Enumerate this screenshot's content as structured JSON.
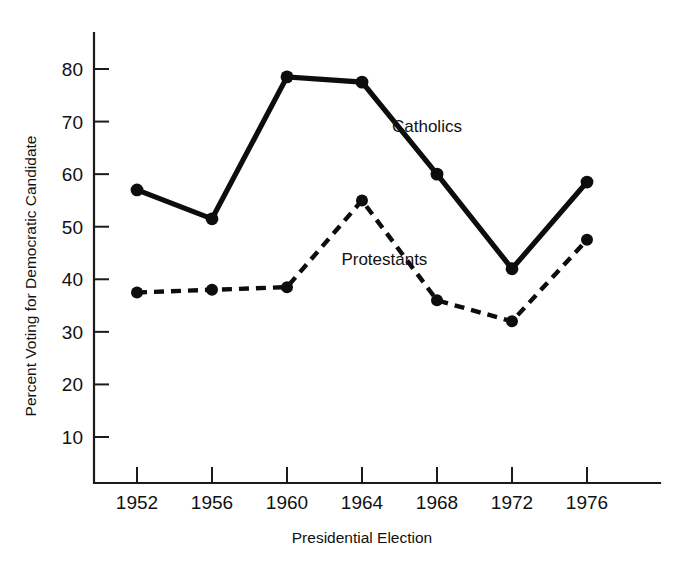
{
  "chart_data": {
    "type": "line",
    "title": "",
    "xlabel": "Presidential Election",
    "ylabel": "Percent Voting for Democratic Candidate",
    "categories": [
      "1952",
      "1956",
      "1960",
      "1964",
      "1968",
      "1972",
      "1976"
    ],
    "x": [
      1952,
      1956,
      1960,
      1964,
      1968,
      1972,
      1976
    ],
    "series": [
      {
        "name": "Catholics",
        "style": "solid",
        "marker": "filled-circle",
        "values": [
          57,
          51.5,
          78.5,
          77.5,
          60,
          42,
          58.5
        ]
      },
      {
        "name": "Protestants",
        "style": "dashed",
        "marker": "filled-circle",
        "values": [
          37.5,
          38,
          38.5,
          55,
          36,
          32,
          47.5
        ]
      }
    ],
    "ylim": [
      0,
      85
    ],
    "xlim": [
      1950,
      1978
    ],
    "yticks": [
      10,
      20,
      30,
      40,
      50,
      60,
      70,
      80
    ],
    "ytick_labels": [
      "10",
      "20",
      "30",
      "40",
      "50",
      "60",
      "70",
      "80"
    ],
    "xticks": [
      1952,
      1956,
      1960,
      1964,
      1968,
      1972,
      1976
    ],
    "xtick_labels": [
      "1952",
      "1956",
      "1960",
      "1964",
      "1968",
      "1972",
      "1976"
    ],
    "grid": false,
    "legend_position": "inline-annotations",
    "annotations": [
      {
        "text": "Catholics",
        "x": 1965.6,
        "y": 68.0
      },
      {
        "text": "Protestants",
        "x": 1962.9,
        "y": 42.8
      }
    ],
    "colors": {
      "ink": "#0d0d0d",
      "axis": "#1b1b1b",
      "background": "#ffffff"
    }
  }
}
